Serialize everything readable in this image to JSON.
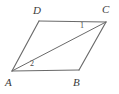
{
  "figure": {
    "kind": "parallelogram-with-diagonal",
    "background_color": "#ffffff",
    "stroke_color": "#6a6a6a",
    "label_color": "#3b3b3b",
    "vertices": [
      {
        "name": "A",
        "label": "A",
        "x": 12,
        "y": 71
      },
      {
        "name": "B",
        "label": "B",
        "x": 79,
        "y": 70
      },
      {
        "name": "C",
        "label": "C",
        "x": 106,
        "y": 22
      },
      {
        "name": "D",
        "label": "D",
        "x": 39,
        "y": 21
      }
    ],
    "edges": [
      {
        "name": "side-DC",
        "from": "D",
        "to": "C"
      },
      {
        "name": "side-CB",
        "from": "C",
        "to": "B"
      },
      {
        "name": "side-BA",
        "from": "B",
        "to": "A"
      },
      {
        "name": "side-AD",
        "from": "A",
        "to": "D"
      },
      {
        "name": "diagonal-AC",
        "from": "A",
        "to": "C"
      }
    ],
    "angle_marks": [
      {
        "name": "angle-1",
        "label": "1",
        "at_vertex": "C",
        "x": 82,
        "y": 26
      },
      {
        "name": "angle-2",
        "label": "2",
        "at_vertex": "A",
        "x": 32,
        "y": 64
      }
    ]
  }
}
